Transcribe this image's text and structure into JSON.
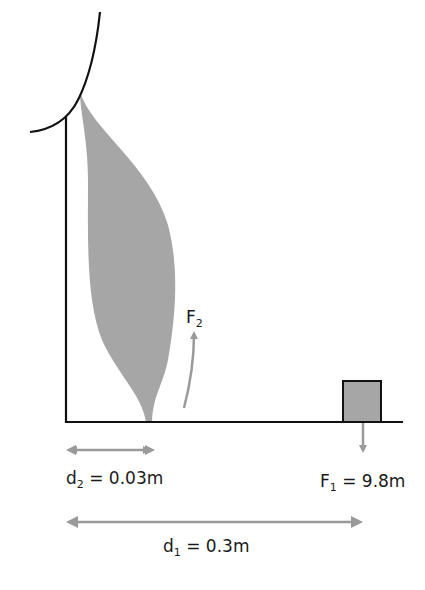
{
  "figure": {
    "type": "lever-muscle-diagram",
    "colors": {
      "line": "#111111",
      "muscle": "#a6a6a6",
      "arrow": "#9a9a9a",
      "weight": "#a6a6a6"
    }
  },
  "labels": {
    "f2": {
      "main": "F",
      "sub": "2",
      "rest": ""
    },
    "f1": {
      "main": "F",
      "sub": "1",
      "rest": " = 9.8m"
    },
    "d2": {
      "main": "d",
      "sub": "2",
      "rest": " = 0.03m"
    },
    "d1": {
      "main": "d",
      "sub": "1",
      "rest": " = 0.3m"
    }
  }
}
